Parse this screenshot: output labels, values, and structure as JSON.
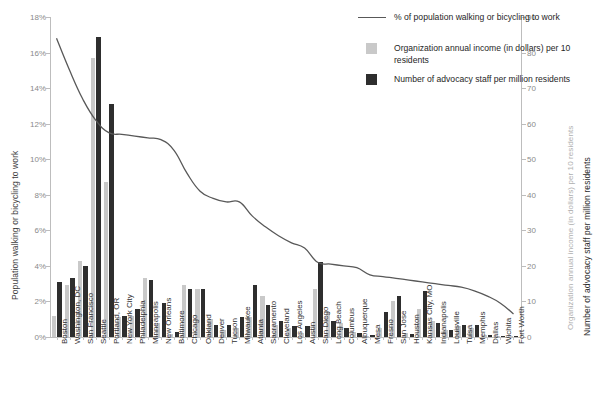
{
  "axes": {
    "left_title": "Population walking or bicycling to work",
    "left_ticks": [
      "0%",
      "2%",
      "4%",
      "6%",
      "8%",
      "10%",
      "12%",
      "14%",
      "16%",
      "18%"
    ],
    "right_title_gray": "Organization annual income (in dollars) per 10 residents",
    "right_title_black": "Number of advocacy staff per million residents",
    "right_ticks": [
      "0",
      "10",
      "20",
      "30",
      "40",
      "50",
      "60",
      "70",
      "80",
      "90"
    ]
  },
  "legend": {
    "items": [
      {
        "name": "line-legend",
        "marker": "line",
        "label": "% of population walking or bicycling to work"
      },
      {
        "name": "gray-bar-legend",
        "marker": "gray-square",
        "label": "Organization annual income (in dollars) per 10 residents"
      },
      {
        "name": "black-bar-legend",
        "marker": "black-square",
        "label": "Number of advocacy staff per million residents"
      }
    ]
  },
  "chart_data": {
    "type": "bar",
    "title": "",
    "xlabel": "",
    "ylabel": "Population walking or bicycling to work",
    "y2label": "Number of advocacy staff per million residents",
    "ylim": [
      0,
      18
    ],
    "y2lim": [
      0,
      90
    ],
    "grid": false,
    "legend_position": "top-right",
    "categories": [
      "Boston",
      "Washington, DC",
      "San Francisco",
      "Seattle",
      "Portland, OR",
      "New York City",
      "Philadelphia",
      "Minneapolis",
      "New Orleans",
      "Baltimore",
      "Chicago",
      "Oakland",
      "Denver",
      "Tucson",
      "Milwaukee",
      "Atlanta",
      "Sacramento",
      "Cleveland",
      "Los Angeles",
      "Austin",
      "San Diego",
      "Long Beach",
      "Columbus",
      "Albuquerque",
      "Mesa",
      "Fresno",
      "San Jose",
      "Houston",
      "Kansas City, MO",
      "Indianapolis",
      "Louisville",
      "Tulsa",
      "Memphis",
      "Dallas",
      "Wichita",
      "Fort Worth"
    ],
    "series": [
      {
        "name": "% of population walking or bicycling to work",
        "type": "line",
        "axis": "left",
        "unit": "%",
        "color": "#585858",
        "values": [
          16.8,
          15.0,
          13.4,
          12.2,
          11.5,
          11.4,
          11.3,
          11.2,
          11.1,
          10.5,
          9.2,
          8.2,
          7.8,
          7.6,
          7.6,
          6.8,
          6.2,
          5.7,
          5.3,
          5.0,
          4.2,
          4.1,
          4.0,
          3.9,
          3.5,
          3.4,
          3.3,
          3.2,
          3.1,
          3.0,
          2.9,
          2.8,
          2.6,
          2.3,
          1.9,
          1.3
        ]
      },
      {
        "name": "Organization annual income (in dollars) per 10 residents",
        "type": "bar",
        "axis": "right",
        "color": "#c9c9c9",
        "values": [
          6.0,
          14.5,
          21.5,
          78.5,
          43.5,
          5.5,
          6.0,
          16.5,
          4.0,
          0.8,
          14.5,
          13.5,
          5.0,
          2.0,
          2.5,
          5.5,
          11.5,
          3.5,
          2.5,
          1.0,
          13.5,
          7.0,
          4.0,
          1.5,
          0.3,
          2.5,
          10.0,
          1.0,
          8.0,
          4.5,
          2.0,
          3.0,
          2.5,
          0.5,
          0.4,
          0.3
        ]
      },
      {
        "name": "Number of advocacy staff per million residents",
        "type": "bar",
        "axis": "right",
        "color": "#2e2e2e",
        "values": [
          15.5,
          16.5,
          20.0,
          84.5,
          65.5,
          6.0,
          8.0,
          16.0,
          9.5,
          1.5,
          13.5,
          13.5,
          3.5,
          3.5,
          5.5,
          14.5,
          9.0,
          4.5,
          3.0,
          3.0,
          21.0,
          4.5,
          2.5,
          1.0,
          0.5,
          7.0,
          11.5,
          0.8,
          13.0,
          4.0,
          2.0,
          3.5,
          3.5,
          0.5,
          0.3,
          0.3
        ]
      }
    ]
  }
}
